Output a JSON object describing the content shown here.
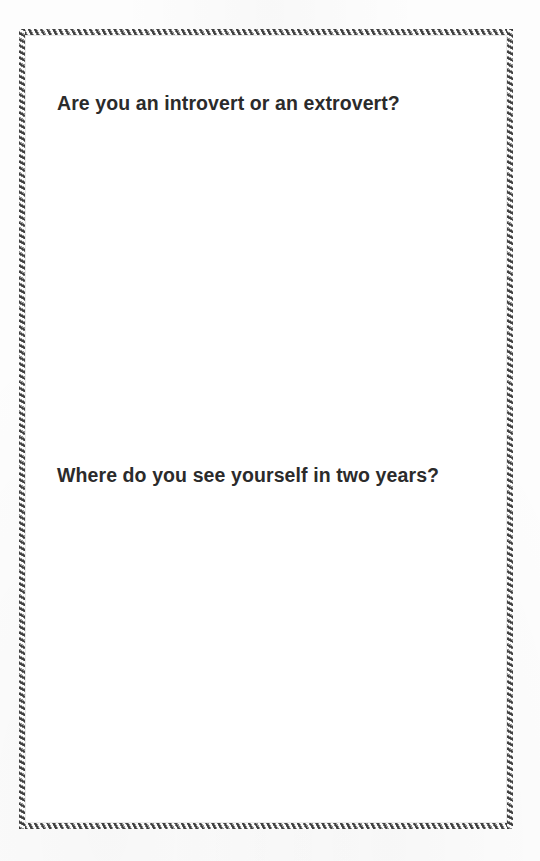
{
  "document": {
    "type": "printed-question-worksheet",
    "background_color": "#fdfdfd",
    "paper_color": "#ffffff",
    "frame": {
      "style": "diagonal-hatch-border",
      "dark_color": "#3a3a3a",
      "light_color": "#fbfbfb"
    },
    "text_color": "#2b2b2b"
  },
  "questions": [
    {
      "index": 1,
      "text": "Are you an introvert or an extrovert?",
      "answer_area_label": ""
    },
    {
      "index": 2,
      "text": "Where do you see yourself in two years?",
      "answer_area_label": ""
    }
  ]
}
